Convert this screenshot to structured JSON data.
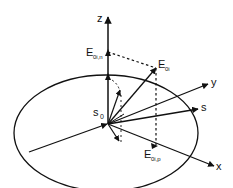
{
  "diagram": {
    "labels": {
      "z": "z",
      "y": "y",
      "x": "x",
      "s": "s",
      "s0": "s",
      "s0_sub": "0",
      "e_n": "E",
      "e_n_sub": "0i,n",
      "e_0i": "E",
      "e_0i_sub": "0i",
      "e_p": "E",
      "e_p_sub": "0i,p"
    },
    "colors": {
      "stroke": "#111111",
      "background": "#ffffff"
    }
  }
}
